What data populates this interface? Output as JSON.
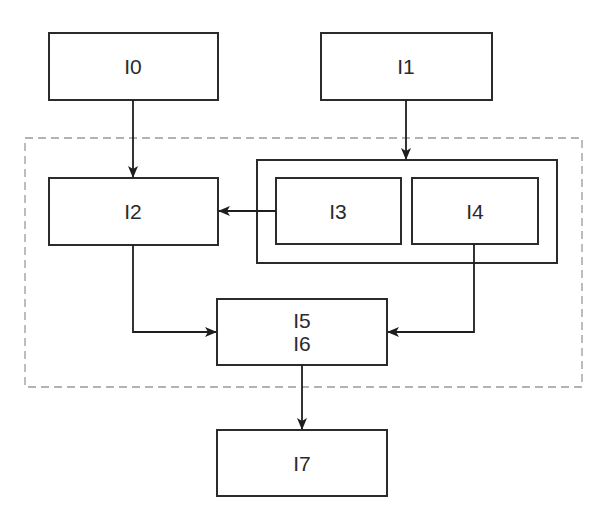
{
  "diagram": {
    "colors": {
      "stroke": "#2b2b2b",
      "dashed": "#9a9a9a",
      "background": "#ffffff"
    },
    "nodes": [
      {
        "id": "I0",
        "label": "I0"
      },
      {
        "id": "I1",
        "label": "I1"
      },
      {
        "id": "I2",
        "label": "I2"
      },
      {
        "id": "I3",
        "label": "I3"
      },
      {
        "id": "I4",
        "label": "I4"
      },
      {
        "id": "I5",
        "label": "I5",
        "label2": "I6"
      },
      {
        "id": "I7",
        "label": "I7"
      }
    ],
    "groups": [
      {
        "id": "dashed-region",
        "style": "dashed",
        "contains": [
          "I2",
          "I3",
          "I4",
          "I5"
        ]
      },
      {
        "id": "I3-I4-group",
        "style": "solid",
        "contains": [
          "I3",
          "I4"
        ]
      }
    ],
    "edges": [
      {
        "from": "I0",
        "to": "I2"
      },
      {
        "from": "I1",
        "to": "I3-I4-group"
      },
      {
        "from": "I3",
        "to": "I2"
      },
      {
        "from": "I2",
        "to": "I5"
      },
      {
        "from": "I4",
        "to": "I5"
      },
      {
        "from": "I5",
        "to": "I7"
      }
    ]
  }
}
